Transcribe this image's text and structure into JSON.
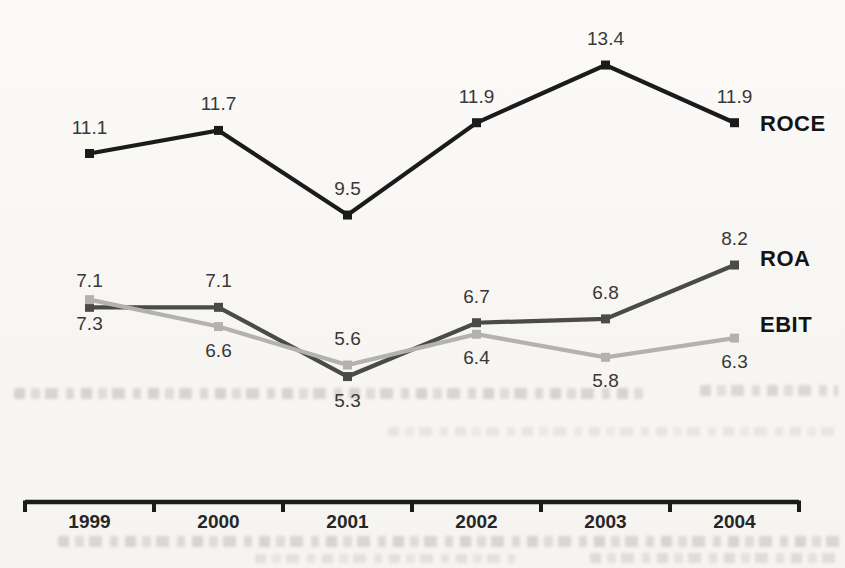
{
  "page": {
    "background_color": "#f8f7f5"
  },
  "chart_data": {
    "type": "line",
    "title": "",
    "xlabel": "",
    "ylabel": "",
    "grid": false,
    "marker": "square",
    "legend_position": "right-of-last-point",
    "axis_color": "#1b1b1b",
    "data_label_color": "#383838",
    "tick_label_color": "#262626",
    "series_label_color": "#141414",
    "categories": [
      "1999",
      "2000",
      "2001",
      "2002",
      "2003",
      "2004"
    ],
    "series": [
      {
        "name": "ROCE",
        "color": "#1b1b1b",
        "values": [
          11.1,
          11.7,
          9.5,
          11.9,
          13.4,
          11.9
        ],
        "label_positions": [
          "above",
          "above",
          "above",
          "above",
          "above",
          "above"
        ]
      },
      {
        "name": "ROA",
        "color": "#4a4a4a",
        "values": [
          7.1,
          7.1,
          5.3,
          6.7,
          6.8,
          8.2
        ],
        "label_positions": [
          "above",
          "above",
          "below",
          "above",
          "above",
          "above"
        ]
      },
      {
        "name": "EBIT",
        "color": "#b3b2ae",
        "values": [
          7.3,
          6.6,
          5.6,
          6.4,
          5.8,
          6.3
        ],
        "label_positions": [
          "below",
          "below",
          "above",
          "below",
          "below",
          "below"
        ]
      }
    ]
  }
}
